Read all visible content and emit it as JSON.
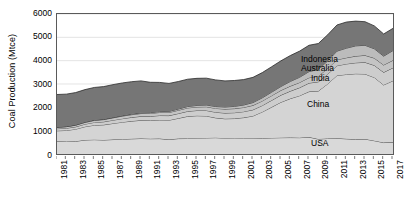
{
  "chart_data": {
    "type": "area",
    "stacked": true,
    "title": "",
    "xlabel": "",
    "ylabel": "Coal Production (Mtce)",
    "ylim": [
      0,
      6000
    ],
    "yticks": [
      0,
      1000,
      2000,
      3000,
      4000,
      5000,
      6000
    ],
    "ytick_labels": [
      "0",
      "1000",
      "2000",
      "3000",
      "4000",
      "5000",
      "6000"
    ],
    "xlim": [
      1981,
      2017
    ],
    "x": [
      1981,
      1982,
      1983,
      1984,
      1985,
      1986,
      1987,
      1988,
      1989,
      1990,
      1991,
      1992,
      1993,
      1994,
      1995,
      1996,
      1997,
      1998,
      1999,
      2000,
      2001,
      2002,
      2003,
      2004,
      2005,
      2006,
      2007,
      2008,
      2009,
      2010,
      2011,
      2012,
      2013,
      2014,
      2015,
      2016,
      2017
    ],
    "xtick_labels": [
      "1981",
      "1983",
      "1985",
      "1987",
      "1989",
      "1991",
      "1993",
      "1995",
      "1997",
      "1999",
      "2001",
      "2003",
      "2005",
      "2007",
      "2009",
      "2011",
      "2013",
      "2015",
      "2017"
    ],
    "grid": true,
    "legend_position": "in-plot-labels",
    "series": [
      {
        "name": "USA",
        "color": "#d9d9d9",
        "label_position": "lower-right",
        "values": [
          555,
          540,
          545,
          600,
          615,
          600,
          620,
          635,
          650,
          665,
          655,
          660,
          620,
          660,
          665,
          680,
          690,
          700,
          680,
          690,
          680,
          680,
          675,
          690,
          700,
          705,
          700,
          725,
          640,
          665,
          675,
          650,
          630,
          640,
          570,
          490,
          510
        ]
      },
      {
        "name": "China",
        "color": "#d4d4d4",
        "label_position": "mid-right",
        "values": [
          440,
          470,
          520,
          570,
          620,
          650,
          690,
          730,
          760,
          780,
          780,
          800,
          830,
          870,
          950,
          960,
          940,
          850,
          830,
          830,
          880,
          950,
          1130,
          1320,
          1520,
          1670,
          1800,
          1950,
          2060,
          2340,
          2690,
          2760,
          2810,
          2790,
          2710,
          2470,
          2630
        ]
      },
      {
        "name": "India",
        "color": "#cdcdcd",
        "label_position": "upper-right",
        "values": [
          90,
          95,
          100,
          110,
          120,
          130,
          140,
          150,
          160,
          170,
          180,
          190,
          195,
          205,
          215,
          225,
          235,
          240,
          245,
          250,
          255,
          265,
          275,
          290,
          305,
          320,
          345,
          365,
          395,
          415,
          420,
          450,
          470,
          500,
          520,
          540,
          555
        ]
      },
      {
        "name": "Australia",
        "color": "#c4c4c4",
        "label_position": "upper-right",
        "values": [
          60,
          65,
          70,
          75,
          85,
          95,
          100,
          110,
          115,
          120,
          125,
          130,
          135,
          140,
          145,
          150,
          160,
          165,
          170,
          175,
          180,
          190,
          195,
          200,
          205,
          215,
          220,
          230,
          240,
          250,
          255,
          265,
          285,
          300,
          310,
          315,
          320
        ]
      },
      {
        "name": "Indonesia",
        "color": "#bcbcbc",
        "label_position": "upper-right",
        "values": [
          5,
          6,
          8,
          10,
          12,
          14,
          17,
          20,
          24,
          28,
          33,
          38,
          45,
          52,
          60,
          68,
          75,
          80,
          88,
          95,
          105,
          120,
          135,
          150,
          165,
          200,
          225,
          260,
          290,
          320,
          370,
          410,
          440,
          430,
          400,
          380,
          420
        ]
      },
      {
        "name": "Other",
        "color": "#767676",
        "label_position": "top-right",
        "values": [
          1400,
          1390,
          1390,
          1395,
          1400,
          1400,
          1405,
          1400,
          1390,
          1370,
          1300,
          1250,
          1200,
          1180,
          1170,
          1160,
          1150,
          1140,
          1120,
          1110,
          1090,
          1080,
          1080,
          1090,
          1100,
          1110,
          1120,
          1130,
          1110,
          1120,
          1120,
          1120,
          1060,
          1010,
          980,
          950,
          950
        ]
      }
    ],
    "totals": [
      2550,
      2566,
      2633,
      2760,
      2852,
      2889,
      2972,
      3045,
      3099,
      3133,
      3073,
      3068,
      3025,
      3107,
      3205,
      3243,
      3250,
      3175,
      3133,
      3150,
      3190,
      3285,
      3490,
      3740,
      3995,
      4220,
      4410,
      4660,
      4735,
      5110,
      5530,
      5655,
      5695,
      5670,
      5490,
      5145,
      5385
    ]
  },
  "labels": {
    "usa": "USA",
    "china": "China",
    "india": "India",
    "australia": "Australia",
    "indonesia": "Indonesia",
    "other": "Other"
  }
}
